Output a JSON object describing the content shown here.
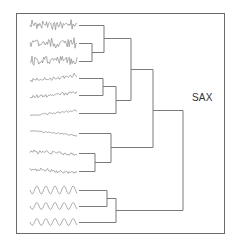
{
  "figure": {
    "label": "SAX",
    "frame": {
      "x": 16,
      "y": 13,
      "w": 208,
      "h": 220,
      "color": "#6a6a6a"
    },
    "line_color": "#7a7a7a",
    "wave_color": "#8a8a8a"
  },
  "leaves": [
    {
      "id": 1,
      "y": 25,
      "kind": "noisy",
      "amp": 4,
      "freq": 2.2,
      "trend": 0
    },
    {
      "id": 2,
      "y": 43,
      "kind": "noisy",
      "amp": 4,
      "freq": 2.2,
      "trend": 0
    },
    {
      "id": 3,
      "y": 61,
      "kind": "noisy",
      "amp": 4,
      "freq": 2.2,
      "trend": 0
    },
    {
      "id": 4,
      "y": 78,
      "kind": "trend-noisy",
      "amp": 1.5,
      "freq": 1.5,
      "trend": -6
    },
    {
      "id": 5,
      "y": 95,
      "kind": "trend-noisy",
      "amp": 1.5,
      "freq": 1.5,
      "trend": -5
    },
    {
      "id": 6,
      "y": 113,
      "kind": "trend-noisy",
      "amp": 0.8,
      "freq": 1.5,
      "trend": -5
    },
    {
      "id": 7,
      "y": 133,
      "kind": "trend-down",
      "amp": 0.6,
      "freq": 1.5,
      "trend": 5
    },
    {
      "id": 8,
      "y": 153,
      "kind": "trend-down",
      "amp": 1.5,
      "freq": 1.0,
      "trend": 3
    },
    {
      "id": 9,
      "y": 171,
      "kind": "trend-down",
      "amp": 1.5,
      "freq": 1.0,
      "trend": 3
    },
    {
      "id": 10,
      "y": 190,
      "kind": "sine",
      "amp": 4,
      "freq": 0.11,
      "trend": 0
    },
    {
      "id": 11,
      "y": 206,
      "kind": "sine",
      "amp": 3.5,
      "freq": 0.11,
      "trend": 0
    },
    {
      "id": 12,
      "y": 222,
      "kind": "sine",
      "amp": 3.5,
      "freq": 0.11,
      "trend": 0
    }
  ],
  "dendrogram": {
    "leaf_x_start": 79,
    "segments": [
      [
        79,
        25,
        104,
        25
      ],
      [
        79,
        43,
        92,
        43
      ],
      [
        79,
        61,
        92,
        61
      ],
      [
        92,
        43,
        92,
        61
      ],
      [
        92,
        52,
        104,
        52
      ],
      [
        104,
        25,
        104,
        52
      ],
      [
        104,
        38,
        131,
        38
      ],
      [
        79,
        78,
        103,
        78
      ],
      [
        79,
        95,
        103,
        95
      ],
      [
        103,
        78,
        103,
        95
      ],
      [
        103,
        86,
        116,
        86
      ],
      [
        79,
        113,
        116,
        113
      ],
      [
        116,
        86,
        116,
        113
      ],
      [
        116,
        100,
        131,
        100
      ],
      [
        131,
        38,
        131,
        100
      ],
      [
        131,
        69,
        153,
        69
      ],
      [
        79,
        133,
        111,
        133
      ],
      [
        79,
        153,
        95,
        153
      ],
      [
        79,
        171,
        95,
        171
      ],
      [
        95,
        153,
        95,
        171
      ],
      [
        95,
        162,
        111,
        162
      ],
      [
        111,
        133,
        111,
        162
      ],
      [
        111,
        147,
        153,
        147
      ],
      [
        153,
        69,
        153,
        147
      ],
      [
        153,
        110,
        183,
        110
      ],
      [
        79,
        190,
        107,
        190
      ],
      [
        79,
        206,
        107,
        206
      ],
      [
        107,
        190,
        107,
        206
      ],
      [
        107,
        198,
        116,
        198
      ],
      [
        79,
        222,
        116,
        222
      ],
      [
        116,
        198,
        116,
        222
      ],
      [
        116,
        210,
        183,
        210
      ],
      [
        183,
        110,
        183,
        210
      ]
    ]
  }
}
